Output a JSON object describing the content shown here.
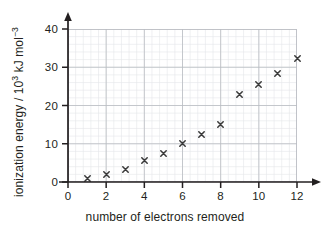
{
  "chart_data": {
    "type": "scatter",
    "title": "",
    "xlabel": "number of electrons removed",
    "ylabel_plain": "ionization energy / 10^3 kJ mol^-3",
    "ylabel_parts": {
      "prefix": "ionization energy / 10",
      "exp1": "3",
      "middle": " kJ mol",
      "exp2": "−3"
    },
    "x": [
      1,
      2,
      3,
      4,
      5,
      6,
      7,
      8,
      9,
      10,
      11,
      12
    ],
    "values": [
      1.0,
      2.0,
      3.2,
      5.5,
      7.5,
      10.0,
      12.3,
      15.0,
      22.8,
      25.6,
      28.3,
      32.2
    ],
    "xlim": [
      0,
      12
    ],
    "ylim": [
      0,
      40
    ],
    "xticks": [
      "0",
      "2",
      "4",
      "6",
      "8",
      "10",
      "12"
    ],
    "xtick_values": [
      0,
      2,
      4,
      6,
      8,
      10,
      12
    ],
    "yticks": [
      "0",
      "10",
      "20",
      "30",
      "40"
    ],
    "ytick_values": [
      0,
      10,
      20,
      30,
      40
    ],
    "grid": "major and minor",
    "legend": "none",
    "marker": "x-cross",
    "colors": {
      "marker": "#3a3a3a",
      "axis": "#231f20",
      "grid_major": "#b9bcc2",
      "grid_minor": "#e2e4e8",
      "background": "#ffffff",
      "text": "#231f20"
    }
  }
}
